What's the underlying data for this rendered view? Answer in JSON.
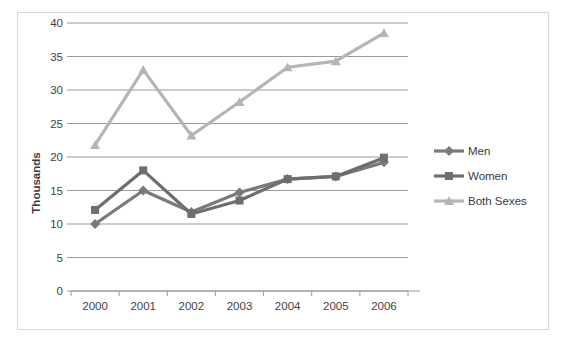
{
  "chart_data": {
    "type": "line",
    "title": "",
    "xlabel": "",
    "ylabel": "Thousands",
    "categories": [
      "2000",
      "2001",
      "2002",
      "2003",
      "2004",
      "2005",
      "2006"
    ],
    "ylim": [
      0,
      40
    ],
    "ytick_step": 5,
    "yticks": [
      "0",
      "5",
      "10",
      "15",
      "20",
      "25",
      "30",
      "35",
      "40"
    ],
    "grid": "horizontal",
    "legend_position": "right",
    "series": [
      {
        "name": "Men",
        "marker": "diamond",
        "color": "#7a7a7a",
        "values": [
          10.0,
          15.0,
          11.8,
          14.7,
          16.7,
          17.1,
          19.2
        ]
      },
      {
        "name": "Women",
        "marker": "square",
        "color": "#6e6e6e",
        "values": [
          12.1,
          18.0,
          11.5,
          13.5,
          16.7,
          17.1,
          19.9
        ]
      },
      {
        "name": "Both Sexes",
        "marker": "triangle",
        "color": "#b5b5b5",
        "values": [
          21.8,
          33.0,
          23.2,
          28.2,
          33.4,
          34.3,
          38.5
        ]
      }
    ]
  },
  "legend": {
    "entries": [
      {
        "label": "Men"
      },
      {
        "label": "Women"
      },
      {
        "label": "Both Sexes"
      }
    ]
  },
  "axis": {
    "y_title": "Thousands"
  }
}
